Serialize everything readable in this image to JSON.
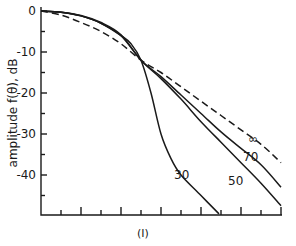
{
  "chart_data": {
    "type": "line",
    "title": "",
    "caption": "(I)",
    "xlabel": "",
    "ylabel": "amplitude f(θ), dB",
    "xlim": [
      0,
      12
    ],
    "ylim": [
      -50,
      0
    ],
    "yticks": [
      0,
      -10,
      -20,
      -30,
      -40
    ],
    "ytick_labels": [
      "0",
      "-10",
      "-20",
      "-30",
      "-40"
    ],
    "xtick_count": 12,
    "xtick_labels": [],
    "grid": false,
    "legend": "inline curve labels",
    "series": [
      {
        "name": "30",
        "style": "solid",
        "x": [
          0,
          1,
          2,
          3,
          4,
          4.5,
          5,
          5.5,
          6,
          6.5,
          7,
          8,
          8.9
        ],
        "y": [
          0,
          -0.3,
          -1.2,
          -3,
          -6,
          -8,
          -12,
          -20,
          -30,
          -36,
          -40,
          -45,
          -49.5
        ]
      },
      {
        "name": "50",
        "style": "solid",
        "x": [
          0,
          1,
          2,
          3,
          4,
          5,
          6,
          7,
          8,
          9,
          10,
          11,
          12
        ],
        "y": [
          0,
          -0.3,
          -1.2,
          -3,
          -6,
          -12,
          -16.5,
          -21.5,
          -27,
          -32,
          -37,
          -42,
          -47.5
        ]
      },
      {
        "name": "70",
        "style": "solid",
        "x": [
          0,
          1,
          2,
          3,
          4,
          5,
          6,
          7,
          8,
          9,
          10,
          11,
          12
        ],
        "y": [
          0,
          -0.3,
          -1.1,
          -2.8,
          -5.8,
          -12,
          -16,
          -20.5,
          -25,
          -29.5,
          -33.5,
          -37.5,
          -43
        ]
      },
      {
        "name": "∞",
        "style": "dashed",
        "x": [
          0,
          1,
          2,
          3,
          4,
          5,
          6,
          7,
          8,
          9,
          10,
          11,
          12
        ],
        "y": [
          0,
          -1,
          -2.8,
          -5,
          -8,
          -12,
          -15,
          -18.5,
          -22,
          -25.5,
          -29,
          -32.5,
          -37
        ]
      }
    ],
    "annotations": [
      "30",
      "50",
      "70",
      "∞"
    ]
  }
}
